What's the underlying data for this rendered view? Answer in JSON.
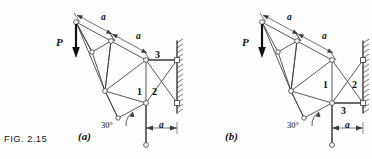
{
  "figure": {
    "caption": "FIG. 2.15",
    "panels": [
      {
        "id": "a",
        "label": "(a)",
        "load_label": "P",
        "angle_label": "30°",
        "dim_labels": [
          "a",
          "a",
          "a"
        ],
        "member_labels": [
          "1",
          "2",
          "3"
        ],
        "member_3_position": "upper-chord-to-wall",
        "wall_side": "right"
      },
      {
        "id": "b",
        "label": "(b)",
        "load_label": "P",
        "angle_label": "30°",
        "dim_labels": [
          "a",
          "a",
          "a"
        ],
        "member_labels": [
          "1",
          "2",
          "3"
        ],
        "member_3_position": "lower-chord-to-wall",
        "wall_side": "right"
      }
    ]
  },
  "colors": {
    "line": "#3a3a3a",
    "ink": "#111111",
    "page": "#fdfdfd",
    "joint_fill": "#ffffff"
  }
}
